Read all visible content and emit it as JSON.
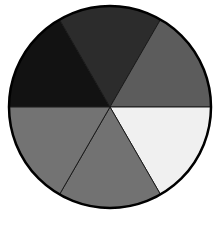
{
  "chart_data": {
    "type": "pie",
    "title": "",
    "xlabel": "",
    "ylabel": "",
    "legend": [],
    "center": [
      110,
      107
    ],
    "radius": 101,
    "start_angle_deg": 180,
    "direction": "clockwise",
    "categories": [
      "Slice 1",
      "Slice 2",
      "Slice 3",
      "Slice 4",
      "Slice 5",
      "Slice 6"
    ],
    "values": [
      1,
      1,
      1,
      1,
      1,
      1
    ],
    "colors": [
      "#121212",
      "#2c2c2c",
      "#5c5c5c",
      "#f0f0f0",
      "#727272",
      "#737373"
    ]
  }
}
